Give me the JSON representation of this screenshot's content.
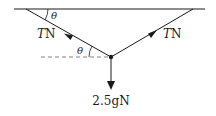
{
  "diagram": {
    "type": "force-diagram",
    "ceiling": {
      "x1": 14,
      "x2": 205,
      "y": 9
    },
    "junction": {
      "x": 111,
      "y": 57
    },
    "left_string": {
      "anchor": {
        "x": 26,
        "y": 9
      },
      "label_var": "T",
      "label_unit": "N"
    },
    "right_string": {
      "anchor": {
        "x": 193,
        "y": 9
      },
      "label_var": "T",
      "label_unit": "N"
    },
    "weight": {
      "label": "2.5gN",
      "label_num": "2.5",
      "label_g": "g",
      "label_unit": "N",
      "tip_y": 89
    },
    "angles": [
      {
        "symbol": "θ",
        "position": "between ceiling and left string"
      },
      {
        "symbol": "θ",
        "position": "between horizontal dashed line and left string"
      }
    ],
    "dashed_horizontal": {
      "x1": 41,
      "x2": 108,
      "y": 57
    },
    "colors": {
      "line": "#1a1a1a",
      "dashed": "#666666"
    }
  }
}
